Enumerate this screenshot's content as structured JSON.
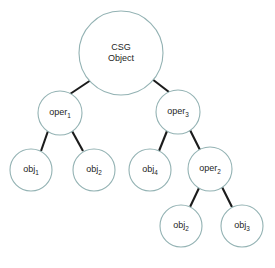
{
  "diagram": {
    "type": "tree",
    "background_color": "#ffffff",
    "node_stroke_color": "#93b2b3",
    "node_fill_color": "#ffffff",
    "edge_color": "#1b1b1b",
    "text_color": "#1e1e1e",
    "nodes": [
      {
        "id": "root",
        "label": "CSG Object",
        "line1": "CSG",
        "line2": "Object",
        "base": "",
        "subscript": "",
        "cx": 121,
        "cy": 53,
        "r": 42,
        "multiline": true
      },
      {
        "id": "oper1",
        "label": "oper1",
        "base": "oper",
        "subscript": "1",
        "cx": 60,
        "cy": 113,
        "r": 22,
        "multiline": false
      },
      {
        "id": "oper3",
        "label": "oper3",
        "base": "oper",
        "subscript": "3",
        "cx": 178,
        "cy": 112,
        "r": 22,
        "multiline": false
      },
      {
        "id": "obj1",
        "label": "obj1",
        "base": "obj",
        "subscript": "1",
        "cx": 31,
        "cy": 170,
        "r": 21,
        "multiline": false
      },
      {
        "id": "obj2a",
        "label": "obj2",
        "base": "obj",
        "subscript": "2",
        "cx": 94,
        "cy": 170,
        "r": 21,
        "multiline": false
      },
      {
        "id": "obj4",
        "label": "obj4",
        "base": "obj",
        "subscript": "4",
        "cx": 150,
        "cy": 170,
        "r": 21,
        "multiline": false
      },
      {
        "id": "oper2",
        "label": "oper2",
        "base": "oper",
        "subscript": "2",
        "cx": 210,
        "cy": 169,
        "r": 22,
        "multiline": false
      },
      {
        "id": "obj2b",
        "label": "obj2",
        "base": "obj",
        "subscript": "2",
        "cx": 181,
        "cy": 226,
        "r": 21,
        "multiline": false
      },
      {
        "id": "obj3",
        "label": "obj3",
        "base": "obj",
        "subscript": "3",
        "cx": 242,
        "cy": 226,
        "r": 21,
        "multiline": false
      }
    ],
    "edges": [
      {
        "id": "root-oper1",
        "from": "root",
        "to": "oper1",
        "x1": 91,
        "y1": 80,
        "x2": 70,
        "y2": 94
      },
      {
        "id": "root-oper3",
        "from": "root",
        "to": "oper3",
        "x1": 152,
        "y1": 79,
        "x2": 169,
        "y2": 92
      },
      {
        "id": "oper1-obj1",
        "from": "oper1",
        "to": "obj1",
        "x1": 48,
        "y1": 131,
        "x2": 41,
        "y2": 151
      },
      {
        "id": "oper1-obj2a",
        "from": "oper1",
        "to": "obj2a",
        "x1": 72,
        "y1": 131,
        "x2": 83,
        "y2": 151
      },
      {
        "id": "oper3-obj4",
        "from": "oper3",
        "to": "obj4",
        "x1": 167,
        "y1": 131,
        "x2": 159,
        "y2": 151
      },
      {
        "id": "oper3-oper2",
        "from": "oper3",
        "to": "oper2",
        "x1": 190,
        "y1": 130,
        "x2": 200,
        "y2": 150
      },
      {
        "id": "oper2-obj2b",
        "from": "oper2",
        "to": "obj2b",
        "x1": 199,
        "y1": 188,
        "x2": 190,
        "y2": 207
      },
      {
        "id": "oper2-obj3",
        "from": "oper2",
        "to": "obj3",
        "x1": 222,
        "y1": 187,
        "x2": 232,
        "y2": 207
      }
    ]
  }
}
